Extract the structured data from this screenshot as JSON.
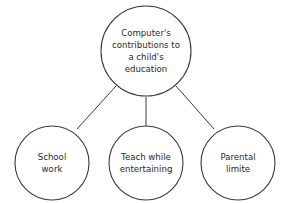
{
  "diagram": {
    "type": "concept-map",
    "root": {
      "lines": [
        "Computer's",
        "contributions to",
        "a child's",
        "education"
      ]
    },
    "children": [
      {
        "lines": [
          "School",
          "work"
        ]
      },
      {
        "lines": [
          "Teach while",
          "entertaining"
        ]
      },
      {
        "lines": [
          "Parental",
          "limite"
        ]
      }
    ],
    "colors": {
      "stroke": "#3a3a3a",
      "text": "#2a2a2a",
      "background": "#ffffff"
    }
  }
}
